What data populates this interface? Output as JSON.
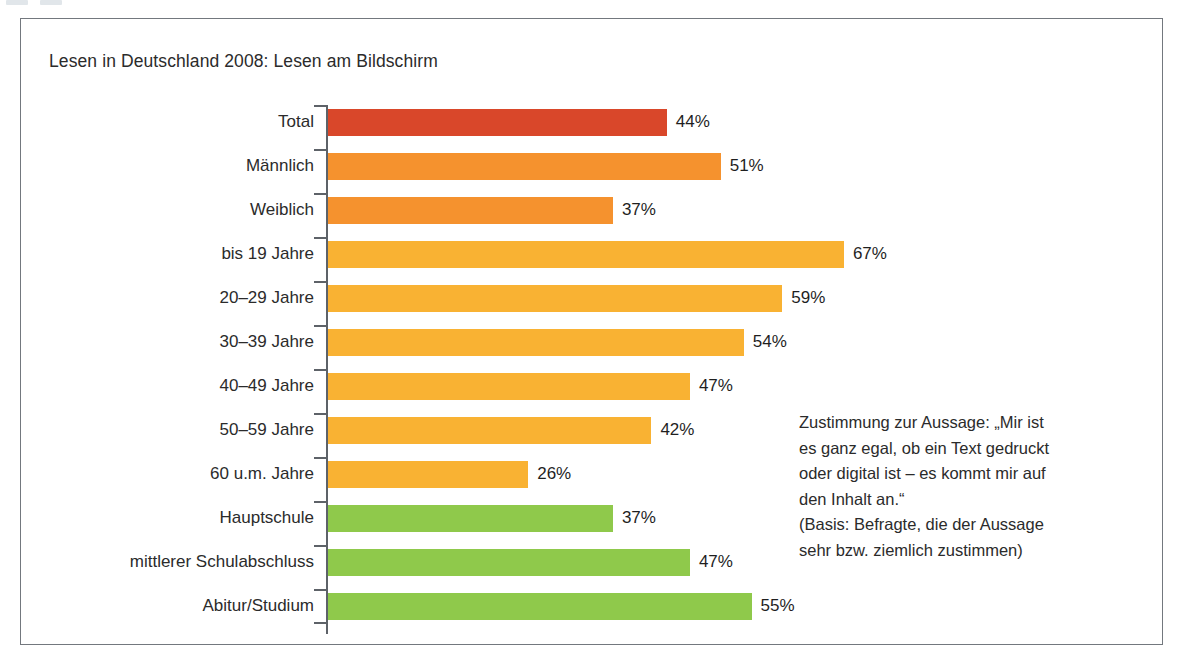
{
  "chart_data": {
    "type": "bar",
    "orientation": "horizontal",
    "title": "Lesen in Deutschland 2008: Lesen am Bildschirm",
    "xlabel": "",
    "ylabel": "",
    "xlim": [
      0,
      70
    ],
    "grid": false,
    "legend": "none",
    "value_suffix": "%",
    "categories": [
      "Total",
      "Männlich",
      "Weiblich",
      "bis 19 Jahre",
      "20–29 Jahre",
      "30–39 Jahre",
      "40–49 Jahre",
      "50–59 Jahre",
      "60 u.m. Jahre",
      "Hauptschule",
      "mittlerer Schulabschluss",
      "Abitur/Studium"
    ],
    "values": [
      44,
      51,
      37,
      67,
      59,
      54,
      47,
      42,
      26,
      37,
      47,
      55
    ],
    "value_labels": [
      "44%",
      "51%",
      "37%",
      "67%",
      "59%",
      "54%",
      "47%",
      "42%",
      "26%",
      "37%",
      "47%",
      "55%"
    ],
    "bar_colors": [
      "#d9472a",
      "#f5922e",
      "#f5922e",
      "#f9b233",
      "#f9b233",
      "#f9b233",
      "#f9b233",
      "#f9b233",
      "#f9b233",
      "#8fc94b",
      "#8fc94b",
      "#8fc94b"
    ],
    "groups": [
      {
        "name": "Gesamt",
        "color": "#d9472a",
        "categories": [
          "Total"
        ]
      },
      {
        "name": "Geschlecht",
        "color": "#f5922e",
        "categories": [
          "Männlich",
          "Weiblich"
        ]
      },
      {
        "name": "Alter",
        "color": "#f9b233",
        "categories": [
          "bis 19 Jahre",
          "20–29 Jahre",
          "30–39 Jahre",
          "40–49 Jahre",
          "50–59 Jahre",
          "60 u.m. Jahre"
        ]
      },
      {
        "name": "Bildung",
        "color": "#8fc94b",
        "categories": [
          "Hauptschule",
          "mittlerer Schulabschluss",
          "Abitur/Studium"
        ]
      }
    ]
  },
  "annotation": {
    "lines": [
      "Zustimmung zur Aussage: „Mir ist",
      "es ganz egal, ob ein Text gedruckt",
      "oder digital ist – es kommt mir auf",
      "den Inhalt an.“",
      "(Basis: Befragte, die der Aussage",
      "sehr bzw. ziemlich zustimmen)"
    ]
  },
  "style": {
    "frame_border_color": "#73787e",
    "axis_color": "#5d6268",
    "text_color": "#2b2b2b",
    "background": "#ffffff"
  }
}
